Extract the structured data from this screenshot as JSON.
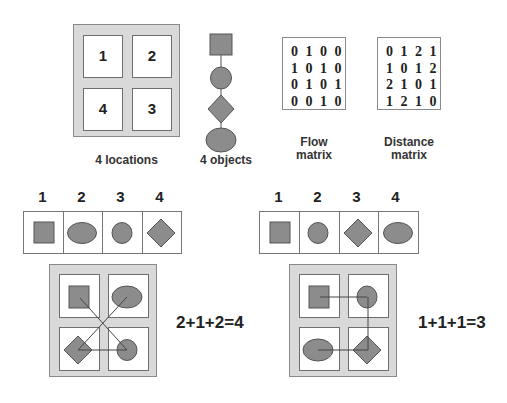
{
  "top_section": {
    "locations": {
      "caption": "4 locations",
      "labels": [
        "1",
        "2",
        "4",
        "3"
      ]
    },
    "objects": {
      "caption": "4 objects",
      "shapes": [
        "square",
        "circle",
        "diamond",
        "ellipse"
      ]
    },
    "flow_matrix": {
      "caption_line1": "Flow",
      "caption_line2": "matrix",
      "rows": [
        "0 1 0 0",
        "1 0 1 0",
        "0 1 0 1",
        "0 0 1 0"
      ]
    },
    "distance_matrix": {
      "caption_line1": "Distance",
      "caption_line2": "matrix",
      "rows": [
        "0 1 2 1",
        "1 0 1 2",
        "2 1 0 1",
        "1 2 1 0"
      ]
    }
  },
  "assignment_left": {
    "position_labels": [
      "1",
      "2",
      "3",
      "4"
    ],
    "shapes": [
      "square",
      "ellipse",
      "circle",
      "diamond"
    ],
    "cost_equation": "2+1+2=4"
  },
  "assignment_right": {
    "position_labels": [
      "1",
      "2",
      "3",
      "4"
    ],
    "shapes": [
      "square",
      "circle",
      "diamond",
      "ellipse"
    ],
    "cost_equation": "1+1+1=3"
  },
  "colors": {
    "shape_fill": "#8c8c8c",
    "frame_fill": "#d9d9d9",
    "line": "#444444"
  }
}
